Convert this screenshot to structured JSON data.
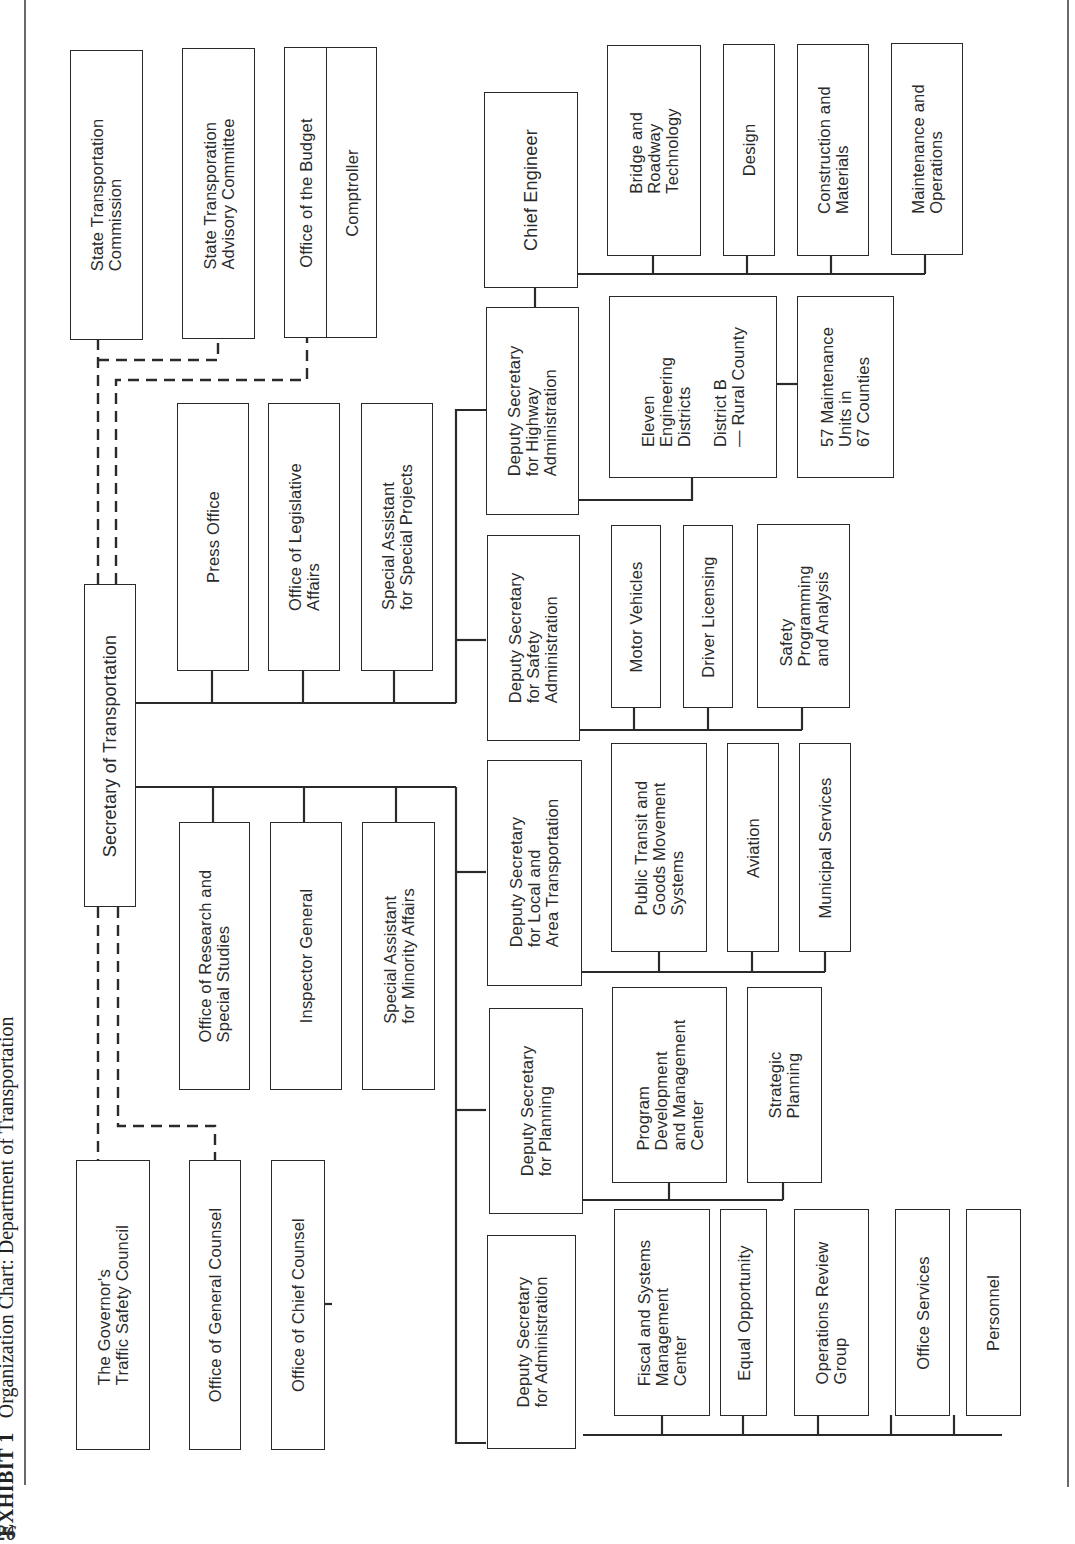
{
  "page": {
    "exhibit_label": "EXHIBIT 1",
    "title": "Organization Chart: Department of Transportation",
    "page_number": "26",
    "orientation": "rotated 90° counter-clockwise"
  },
  "chart": {
    "top": {
      "secretary": "Secretary of Transportation"
    },
    "advisory_dashed": {
      "state_transportation_commission": "State Transportation\nCommission",
      "state_transportation_advisory_committee": "State Transporation\nAdvisory Committee",
      "office_of_the_budget": "Office of the Budget",
      "comptroller": "Comptroller",
      "governors_traffic_safety_council": "The Governor's\nTraffic Safety Council",
      "office_of_general_counsel": "Office of General Counsel",
      "office_of_chief_counsel": "Office of Chief Counsel"
    },
    "staff_upper": [
      "Press Office",
      "Office of Legislative\nAffairs",
      "Special Assistant\nfor Special Projects"
    ],
    "staff_lower": [
      "Office of Research and\nSpecial Studies",
      "Inspector General",
      "Special Assistant\nfor Minority Affairs"
    ],
    "deputies": {
      "highway": {
        "label": "Deputy Secretary\nfor Highway\nAdministration",
        "chief_engineer": "Chief Engineer",
        "engineer_units": [
          "Bridge and\nRoadway\nTechnology",
          "Design",
          "Construction and\nMaterials",
          "Maintenance and\nOperations"
        ],
        "districts": "Eleven\nEngineering\nDistricts\n\nDistrict B\n— Rural County",
        "maintenance_units": "57 Maintenance\nUnits in\n67 Counties"
      },
      "safety": {
        "label": "Deputy Secretary\nfor Safety\nAdministration",
        "units": [
          "Motor Vehicles",
          "Driver Licensing",
          "Safety\nProgramming\nand Analysis"
        ]
      },
      "local": {
        "label": "Deputy Secretary\nfor Local and\nArea Transportation",
        "units": [
          "Public Transit and\nGoods Movement\nSystems",
          "Aviation",
          "Municipal Services"
        ]
      },
      "planning": {
        "label": "Deputy Secretary\nfor Planning",
        "units": [
          "Program\nDevelopment\nand Management\nCenter",
          "Strategic\nPlanning"
        ]
      },
      "administration": {
        "label": "Deputy Secretary\nfor Administration",
        "units": [
          "Fiscal and Systems\nManagement\nCenter",
          "Equal Opportunity",
          "Operations Review\nGroup",
          "Office Services",
          "Personnel"
        ]
      }
    },
    "colors": {
      "line": "#2a2a2a",
      "background": "#ffffff"
    }
  }
}
